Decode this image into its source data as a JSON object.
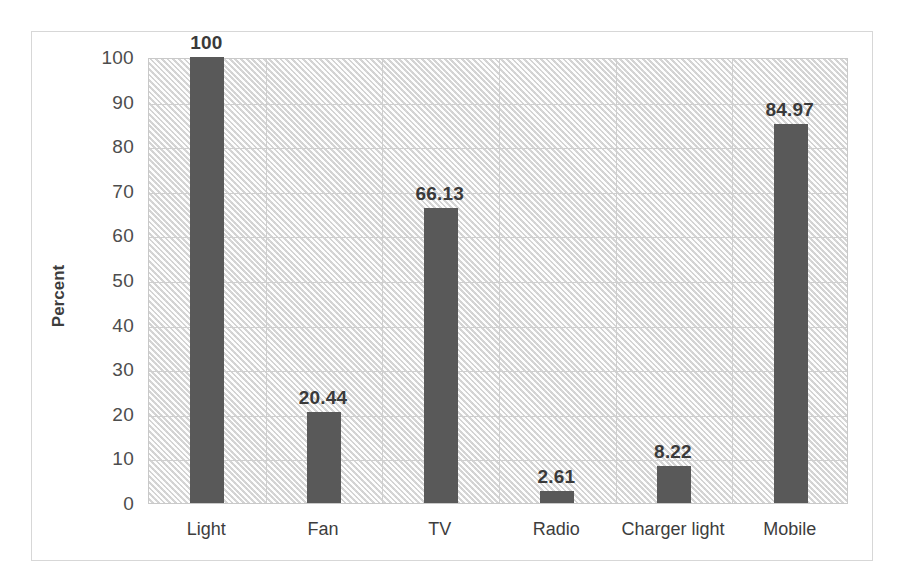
{
  "chart_data": {
    "type": "bar",
    "title": "",
    "subtitle": "",
    "xlabel": "",
    "ylabel": "Percent",
    "categories": [
      "Light",
      "Fan",
      "TV",
      "Radio",
      "Charger light",
      "Mobile"
    ],
    "values": [
      100,
      20.44,
      66.13,
      2.61,
      8.22,
      84.97
    ],
    "value_labels": [
      "100",
      "20.44",
      "66.13",
      "2.61",
      "8.22",
      "84.97"
    ],
    "ylim": [
      0,
      100
    ],
    "yticks": [
      0,
      10,
      20,
      30,
      40,
      50,
      60,
      70,
      80,
      90,
      100
    ],
    "ytick_labels": [
      "0",
      "10",
      "20",
      "30",
      "40",
      "50",
      "60",
      "70",
      "80",
      "90",
      "100"
    ],
    "grid": true,
    "grid_axes": "both",
    "legend": false,
    "legend_position": "none",
    "series": [
      {
        "name": "Percent",
        "values": [
          100,
          20.44,
          66.13,
          2.61,
          8.22,
          84.97
        ],
        "color": "#595959"
      }
    ],
    "colors": {
      "bar": "#595959",
      "plot_background": "#f2f2f2",
      "grid": "#cfcfcf",
      "frame": "#d7d7d7",
      "text": "#3d3d3d"
    }
  }
}
